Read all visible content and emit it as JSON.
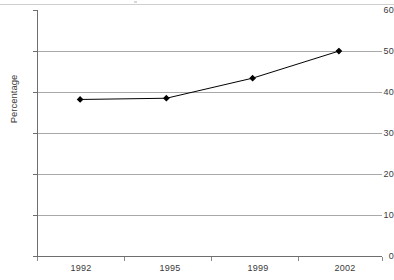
{
  "page": {
    "background_color": "#ffffff",
    "rule_color": "#cfcfcf"
  },
  "chart_data": {
    "type": "line",
    "title": "",
    "subtitle": "",
    "xlabel": "",
    "ylabel": "Percentage",
    "categories": [
      "1992",
      "1995",
      "1999",
      "2002"
    ],
    "values": [
      38.3,
      38.6,
      43.5,
      50.1
    ],
    "series": [
      {
        "name": "Percentage",
        "values": [
          38.3,
          38.6,
          43.5,
          50.1
        ],
        "line_color": "#000000",
        "marker": "diamond",
        "marker_color": "#000000"
      }
    ],
    "ylim": [
      0,
      60
    ],
    "ytick_step": 10,
    "yticks": [
      "0",
      "10",
      "20",
      "30",
      "40",
      "50",
      "60"
    ],
    "xticks": [
      "1992",
      "1995",
      "1999",
      "2002"
    ],
    "grid": {
      "horizontal": true,
      "vertical": false,
      "color": "#a9a9a9"
    },
    "legend": {
      "visible": false,
      "position": "none"
    },
    "axis_color": "#6e6e6e",
    "annotations": []
  }
}
